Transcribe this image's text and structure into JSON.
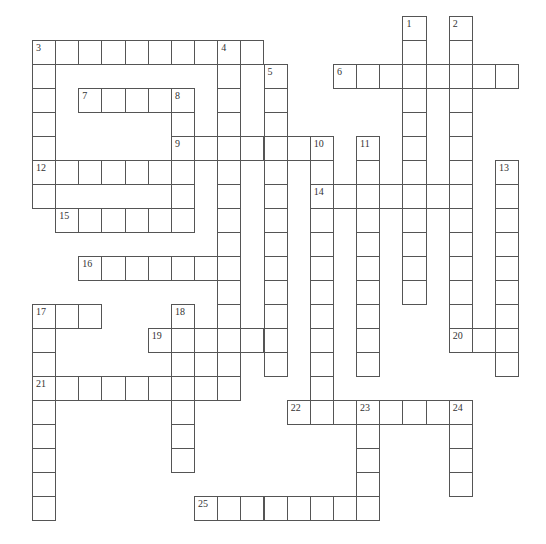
{
  "puzzle": {
    "type": "crossword",
    "grid": {
      "cols": 21,
      "rows": 21,
      "origin_x": 32,
      "origin_y": 16,
      "cell_w": 23.15,
      "cell_h": 24
    },
    "colors": {
      "line": "#555555",
      "cell_bg": "#ffffff",
      "number": "#333333"
    },
    "across": [
      {
        "number": "3",
        "row": 1,
        "col": 0,
        "length": 10
      },
      {
        "number": "6",
        "row": 2,
        "col": 13,
        "length": 8
      },
      {
        "number": "7",
        "row": 3,
        "col": 2,
        "length": 5
      },
      {
        "number": "9",
        "row": 5,
        "col": 6,
        "length": 7
      },
      {
        "number": "12",
        "row": 6,
        "col": 0,
        "length": 7
      },
      {
        "number": "14",
        "row": 7,
        "col": 12,
        "length": 7
      },
      {
        "number": "15",
        "row": 8,
        "col": 1,
        "length": 6
      },
      {
        "number": "16",
        "row": 10,
        "col": 2,
        "length": 7
      },
      {
        "number": "17",
        "row": 12,
        "col": 0,
        "length": 3
      },
      {
        "number": "19",
        "row": 13,
        "col": 5,
        "length": 6
      },
      {
        "number": "20",
        "row": 13,
        "col": 18,
        "length": 3
      },
      {
        "number": "21",
        "row": 15,
        "col": 0,
        "length": 9
      },
      {
        "number": "22",
        "row": 16,
        "col": 11,
        "length": 8
      },
      {
        "number": "25",
        "row": 20,
        "col": 7,
        "length": 8
      }
    ],
    "down": [
      {
        "number": "1",
        "row": 0,
        "col": 16,
        "length": 12
      },
      {
        "number": "2",
        "row": 0,
        "col": 18,
        "length": 14
      },
      {
        "number": "3",
        "row": 1,
        "col": 0,
        "length": 7
      },
      {
        "number": "4",
        "row": 1,
        "col": 8,
        "length": 15
      },
      {
        "number": "5",
        "row": 2,
        "col": 10,
        "length": 13
      },
      {
        "number": "8",
        "row": 3,
        "col": 6,
        "length": 6
      },
      {
        "number": "10",
        "row": 5,
        "col": 12,
        "length": 12
      },
      {
        "number": "11",
        "row": 5,
        "col": 14,
        "length": 10
      },
      {
        "number": "13",
        "row": 6,
        "col": 20,
        "length": 9
      },
      {
        "number": "17",
        "row": 12,
        "col": 0,
        "length": 9
      },
      {
        "number": "18",
        "row": 12,
        "col": 6,
        "length": 7
      },
      {
        "number": "23",
        "row": 16,
        "col": 14,
        "length": 5
      },
      {
        "number": "24",
        "row": 16,
        "col": 18,
        "length": 4
      }
    ]
  }
}
